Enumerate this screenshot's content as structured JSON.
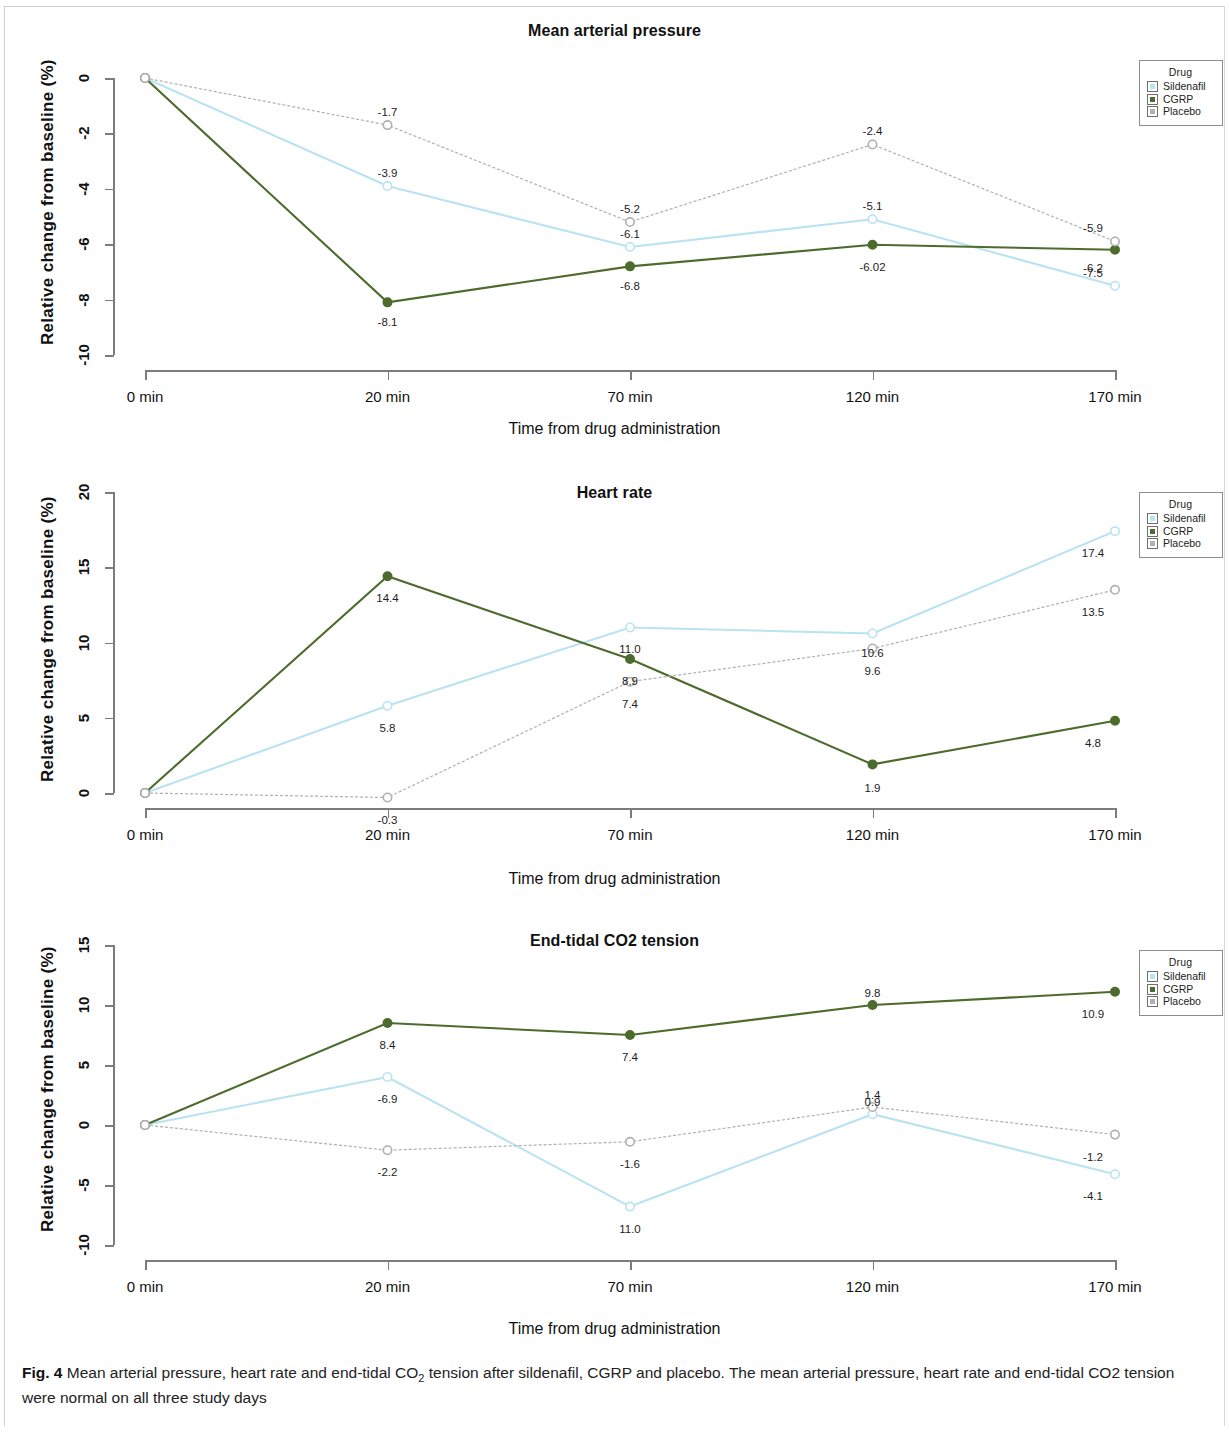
{
  "figure": {
    "label": "Fig. 4",
    "caption_part1": " Mean arterial pressure, heart rate and end-tidal CO",
    "caption_sub": "2",
    "caption_part2": " tension after sildenafil, CGRP and placebo. The mean arterial pressure, heart rate and end-tidal CO2 tension were normal on all three study days"
  },
  "legend": {
    "title": "Drug",
    "items": [
      {
        "label": "Sildenafil",
        "color": "#b9e3f2"
      },
      {
        "label": "CGRP",
        "color": "#4d6b2c"
      },
      {
        "label": "Placebo",
        "color": "#b0b0b0"
      }
    ]
  },
  "common": {
    "ylabel": "Relative change from  baseline (%)",
    "xlabel": "Time from drug administration",
    "categories": [
      "0 min",
      "20 min",
      "70 min",
      "120 min",
      "170 min"
    ]
  },
  "chart_data": [
    {
      "type": "line",
      "title": "Mean arterial pressure",
      "xlabel": "Time from drug administration",
      "ylabel": "Relative change from  baseline (%)",
      "categories": [
        "0 min",
        "20 min",
        "70 min",
        "120 min",
        "170 min"
      ],
      "yticks": [
        "0",
        "-2",
        "-4",
        "-6",
        "-8",
        "-10"
      ],
      "ylim": [
        -10,
        0
      ],
      "grid": false,
      "legend_position": "top-right-outside",
      "series": [
        {
          "name": "Sildenafil",
          "color": "#b9e3f2",
          "values": [
            0,
            -3.9,
            -6.1,
            -5.1,
            -7.5
          ],
          "labels": [
            "",
            "-3.9",
            "-6.1",
            "-5.1",
            "-7.5"
          ]
        },
        {
          "name": "CGRP",
          "color": "#4d6b2c",
          "values": [
            0,
            -8.1,
            -6.8,
            -6.02,
            -6.2
          ],
          "labels": [
            "",
            "-8.1",
            "-6.8",
            "-6.02",
            "-6.2"
          ]
        },
        {
          "name": "Placebo",
          "color": "#b0b0b0",
          "values": [
            0,
            -1.7,
            -5.2,
            -2.4,
            -5.9
          ],
          "labels": [
            "",
            "-1.7",
            "-5.2",
            "-2.4",
            "-5.9"
          ]
        }
      ]
    },
    {
      "type": "line",
      "title": "Heart rate",
      "xlabel": "Time from drug administration",
      "ylabel": "Relative change from  baseline (%)",
      "categories": [
        "0 min",
        "20 min",
        "70 min",
        "120 min",
        "170 min"
      ],
      "yticks": [
        "20",
        "15",
        "10",
        "5",
        "0"
      ],
      "ylim": [
        0,
        20
      ],
      "grid": false,
      "legend_position": "top-right-outside",
      "series": [
        {
          "name": "Sildenafil",
          "color": "#b9e3f2",
          "values": [
            0,
            5.8,
            11.0,
            10.6,
            17.4
          ],
          "labels": [
            "",
            "5.8",
            "11.0",
            "10.6",
            "17.4"
          ]
        },
        {
          "name": "CGRP",
          "color": "#4d6b2c",
          "values": [
            0,
            14.4,
            8.9,
            1.9,
            4.8
          ],
          "labels": [
            "",
            "14.4",
            "8.9",
            "1.9",
            "4.8"
          ]
        },
        {
          "name": "Placebo",
          "color": "#b0b0b0",
          "values": [
            0,
            -0.3,
            7.4,
            9.6,
            13.5
          ],
          "labels": [
            "",
            "-0.3",
            "7.4",
            "9.6",
            "13.5"
          ]
        }
      ]
    },
    {
      "type": "line",
      "title": "End-tidal CO2 tension",
      "xlabel": "Time from drug administration",
      "ylabel": "Relative change from  baseline (%)",
      "categories": [
        "0 min",
        "20 min",
        "70 min",
        "120 min",
        "170 min"
      ],
      "yticks": [
        "15",
        "10",
        "5",
        "0",
        "-5",
        "-10"
      ],
      "ylim": [
        -10,
        15
      ],
      "grid": false,
      "legend_position": "top-right-outside",
      "series": [
        {
          "name": "Sildenafil",
          "color": "#b9e3f2",
          "values": [
            0,
            4.0,
            -6.8,
            0.9,
            -4.1
          ],
          "labels": [
            "",
            "-6.9",
            "11.0",
            "0.9",
            "-4.1"
          ]
        },
        {
          "name": "CGRP",
          "color": "#4d6b2c",
          "values": [
            0,
            8.5,
            7.5,
            10.0,
            11.1
          ],
          "labels": [
            "",
            "8.4",
            "7.4",
            "9.8",
            "10.9"
          ]
        },
        {
          "name": "Placebo",
          "color": "#b0b0b0",
          "values": [
            0,
            -2.1,
            -1.4,
            1.5,
            -0.8
          ],
          "labels": [
            "",
            "-2.2",
            "-1.6",
            "1.4",
            "-1.2"
          ]
        }
      ]
    }
  ]
}
